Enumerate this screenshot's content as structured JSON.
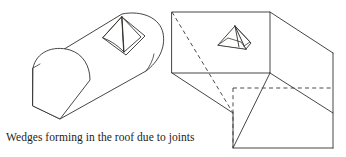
{
  "figure": {
    "caption": "Wedges forming in the roof due to joints",
    "background_color": "#ffffff",
    "line_color": "#33312f",
    "dashed_line_color": "#45423f",
    "width": 346,
    "height": 157,
    "diagrams": [
      {
        "id": "arched-tunnel",
        "label": "Arched roof tunnel with roof wedge",
        "shape": "extruded D-section tunnel",
        "features": [
          "semicircular arch roof",
          "flat floor",
          "near end face visible as D-shaped cap",
          "diamond shaped joint-bounded wedge in roof",
          "inner pyramidal wedge block with vertical ridge"
        ]
      },
      {
        "id": "rectangular-tunnel",
        "label": "Rectangular roof tunnel with roof wedge",
        "shape": "rectangular prism opening",
        "features": [
          "flat rectangular roof",
          "hidden edges shown dashed",
          "diagonal dashed line across roof",
          "tent shaped wedge block on roof surface"
        ]
      }
    ]
  }
}
